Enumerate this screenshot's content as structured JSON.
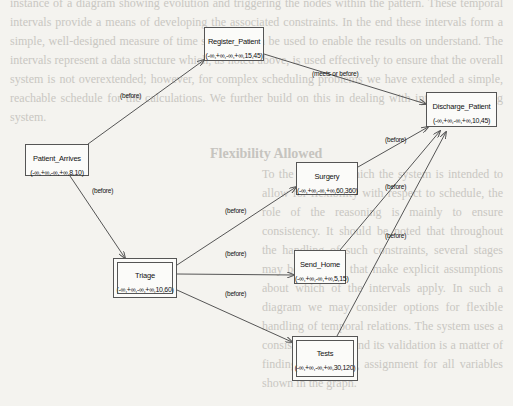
{
  "background": {
    "heading": "Flexibility Allowed",
    "top_text": "instance of a diagram showing evolution and triggering the nodes within the pattern. These temporal intervals provide a means of developing the associated constraints. In the end these intervals form a simple, well-designed measure of time span that can be used to enable the results on understand. The intervals represent a data structure which, as noted above, is used effectively to ensure that the overall system is not overextended; however, for complex scheduling problems we have extended a simple, reachable schedule for the calculations. We further build on this in dealing with interval reasoning system.",
    "bottom_text": "To the extent to which the system is intended to allow for flexibility with respect to schedule, the role of the reasoning is mainly to ensure consistency. It should be noted that throughout the handling of such constraints, several stages may be involved that make explicit assumptions about which of the intervals apply. In such a diagram we may consider options for flexible handling of temporal relations. The system uses a consistency check and its validation is a matter of finding a satisfying assignment for all variables shown in the graph."
  },
  "nodes": [
    {
      "id": "patient_arrives",
      "name": "Patient_Arrives",
      "interval": "(-∞,+∞,-∞,+∞,8,10)",
      "x": 25,
      "y": 144,
      "w": 64,
      "h": 32,
      "double": false
    },
    {
      "id": "register_patient",
      "name": "Register_Patient",
      "interval": "(-∞,+∞,-∞,+∞,15,45)",
      "x": 204,
      "y": 27,
      "w": 60,
      "h": 34,
      "double": false
    },
    {
      "id": "discharge_patient",
      "name": "Discharge_Patient",
      "interval": "(-∞,+∞,-∞,+∞,10,45)",
      "x": 426,
      "y": 92,
      "w": 71,
      "h": 35,
      "double": false
    },
    {
      "id": "triage",
      "name": "Triage",
      "interval": "(-∞,+∞,-∞,+∞,10,60)",
      "x": 113,
      "y": 258,
      "w": 64,
      "h": 40,
      "double": true
    },
    {
      "id": "surgery",
      "name": "Surgery",
      "interval": "(-∞,+∞,-∞,+∞,60,360)",
      "x": 296,
      "y": 162,
      "w": 62,
      "h": 33,
      "double": false
    },
    {
      "id": "send_home",
      "name": "Send_Home",
      "interval": "(-∞,+∞,-∞,+∞,5,15)",
      "x": 294,
      "y": 250,
      "w": 52,
      "h": 34,
      "double": false
    },
    {
      "id": "tests",
      "name": "Tests",
      "interval": "(-∞,+∞,-∞,+∞,30,120)",
      "x": 292,
      "y": 336,
      "w": 66,
      "h": 45,
      "double": true
    }
  ],
  "edges": [
    {
      "from": "patient_arrives",
      "to": "register_patient",
      "label": "(before)",
      "x1": 88,
      "y1": 144,
      "x2": 204,
      "y2": 60,
      "lx": 120,
      "ly": 92
    },
    {
      "from": "register_patient",
      "to": "discharge_patient",
      "label": "(meets or before)",
      "x1": 264,
      "y1": 54,
      "x2": 426,
      "y2": 104,
      "lx": 312,
      "ly": 70
    },
    {
      "from": "patient_arrives",
      "to": "triage",
      "label": "(before)",
      "x1": 70,
      "y1": 176,
      "x2": 125,
      "y2": 258,
      "lx": 92,
      "ly": 187
    },
    {
      "from": "triage",
      "to": "surgery",
      "label": "(before)",
      "x1": 177,
      "y1": 265,
      "x2": 296,
      "y2": 187,
      "lx": 225,
      "ly": 207
    },
    {
      "from": "triage",
      "to": "send_home",
      "label": "(before)",
      "x1": 177,
      "y1": 274,
      "x2": 294,
      "y2": 275,
      "lx": 225,
      "ly": 250
    },
    {
      "from": "triage",
      "to": "tests",
      "label": "(before)",
      "x1": 177,
      "y1": 290,
      "x2": 292,
      "y2": 342,
      "lx": 225,
      "ly": 290
    },
    {
      "from": "surgery",
      "to": "discharge_patient",
      "label": "(before)",
      "x1": 358,
      "y1": 167,
      "x2": 428,
      "y2": 127,
      "lx": 385,
      "ly": 136
    },
    {
      "from": "send_home",
      "to": "discharge_patient",
      "label": "(before)",
      "x1": 340,
      "y1": 250,
      "x2": 440,
      "y2": 131,
      "lx": 385,
      "ly": 183
    },
    {
      "from": "tests",
      "to": "discharge_patient",
      "label": "(before)",
      "x1": 337,
      "y1": 336,
      "x2": 446,
      "y2": 132,
      "lx": 385,
      "ly": 232
    }
  ],
  "colors": {
    "line": "#555555",
    "node_border": "#555555",
    "paper": "#f4f3ef"
  }
}
